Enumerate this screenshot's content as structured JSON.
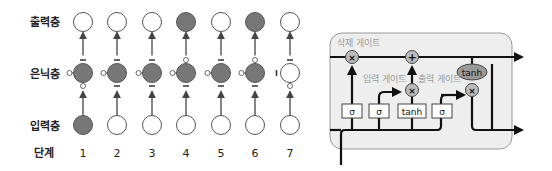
{
  "left_diagram": {
    "row_labels": {
      "output": "출력층",
      "hidden": "은닉층",
      "input": "입력층",
      "step": "단계"
    },
    "steps": [
      "1",
      "2",
      "3",
      "4",
      "5",
      "6",
      "7"
    ],
    "output_filled": [
      false,
      false,
      false,
      true,
      false,
      true,
      false
    ],
    "hidden_filled": [
      true,
      true,
      true,
      true,
      true,
      true,
      false
    ],
    "input_filled": [
      true,
      false,
      false,
      false,
      false,
      false,
      false
    ],
    "colors": {
      "filled": "#777777",
      "stroke": "#555555",
      "empty": "#ffffff"
    }
  },
  "right_diagram": {
    "forget_gate_label": "삭제 게이트",
    "input_gate_label": "입력 게이트",
    "output_gate_label": "출력 게이트",
    "sigma_1": "σ",
    "sigma_2": "σ",
    "tanh_box": "tanh",
    "sigma_3": "σ",
    "tanh_oval": "tanh",
    "multiply_symbol": "×",
    "add_symbol": "+",
    "colors": {
      "box_fill": "#eeeeee",
      "box_stroke": "#999999",
      "op_fill": "#bbbbbb",
      "line": "#111111"
    }
  }
}
